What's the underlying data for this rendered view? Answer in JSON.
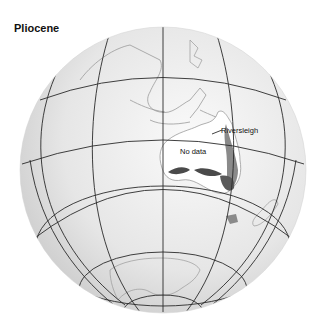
{
  "map": {
    "title": "Pliocene",
    "labels": {
      "site": "Riversleigh",
      "no_data": "No data"
    },
    "colors": {
      "globe_light": "#f4f4f4",
      "globe_dark": "#c8c8c8",
      "grid": "#2a2a2a",
      "coast": "#9a9a9a",
      "land_highlight": "#ffffff",
      "forest_dark": "#4a4a4a",
      "forest_mid": "#8a8a8a"
    }
  }
}
